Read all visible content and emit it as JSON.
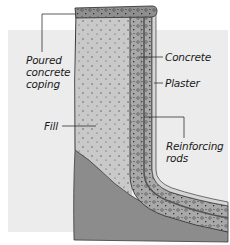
{
  "diagram": {
    "type": "pool-wall-cross-section",
    "colors": {
      "background": "#ffffff",
      "panel": "#ececec",
      "fill": "#c9c9c9",
      "ground": "#8c8c8c",
      "concrete": "#a9a9a9",
      "plaster": "#d6d6d6",
      "rods": "#555555",
      "outline": "#3a3a3a",
      "leader": "#333333"
    },
    "labels": {
      "coping_line1": "Poured",
      "coping_line2": "concrete",
      "coping_line3": "coping",
      "fill": "Fill",
      "concrete": "Concrete",
      "plaster": "Plaster",
      "rods_line1": "Reinforcing",
      "rods_line2": "rods"
    }
  }
}
